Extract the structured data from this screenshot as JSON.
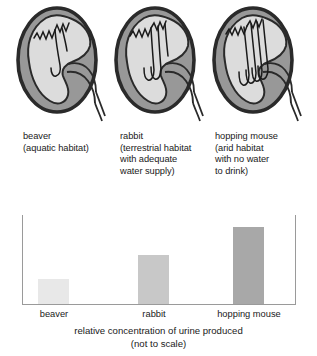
{
  "figure": {
    "title": "relative concentration of urine produced",
    "subtitle": "(not to scale)"
  },
  "specimens": [
    {
      "name": "beaver",
      "label_lines": [
        "beaver",
        "(aquatic habitat)"
      ],
      "habitat": "aquatic habitat",
      "loop_count": 1,
      "loop_length": "short"
    },
    {
      "name": "rabbit",
      "label_lines": [
        "rabbit",
        "(terrestrial habitat",
        "with adequate",
        "water supply)"
      ],
      "habitat": "terrestrial habitat with adequate water supply",
      "loop_count": 2,
      "loop_length": "medium"
    },
    {
      "name": "hopping mouse",
      "label_lines": [
        "hopping mouse",
        "(arid habitat",
        "with no water",
        "to drink)"
      ],
      "habitat": "arid habitat with no water to drink",
      "loop_count": 4,
      "loop_length": "long"
    }
  ],
  "chart_data": {
    "type": "bar",
    "title": "relative concentration of urine produced",
    "subtitle": "(not to scale)",
    "categories": [
      "beaver",
      "rabbit",
      "hopping mouse"
    ],
    "values": [
      26,
      50,
      79
    ],
    "ylim": [
      0,
      90
    ],
    "xlabel": "",
    "ylabel": "",
    "grid": false,
    "legend": "none",
    "axis_color": "#9a9a9a",
    "bar_colors": [
      "#e8e8e8",
      "#c8c8c8",
      "#a8a8a8"
    ]
  },
  "colors": {
    "kidney_outline": "#2a2a2a",
    "kidney_cortex": "#989898",
    "kidney_medulla": "#dcdcdc",
    "nephron": "#1a1a1a",
    "text": "#1a1a1a",
    "background": "#ffffff"
  }
}
